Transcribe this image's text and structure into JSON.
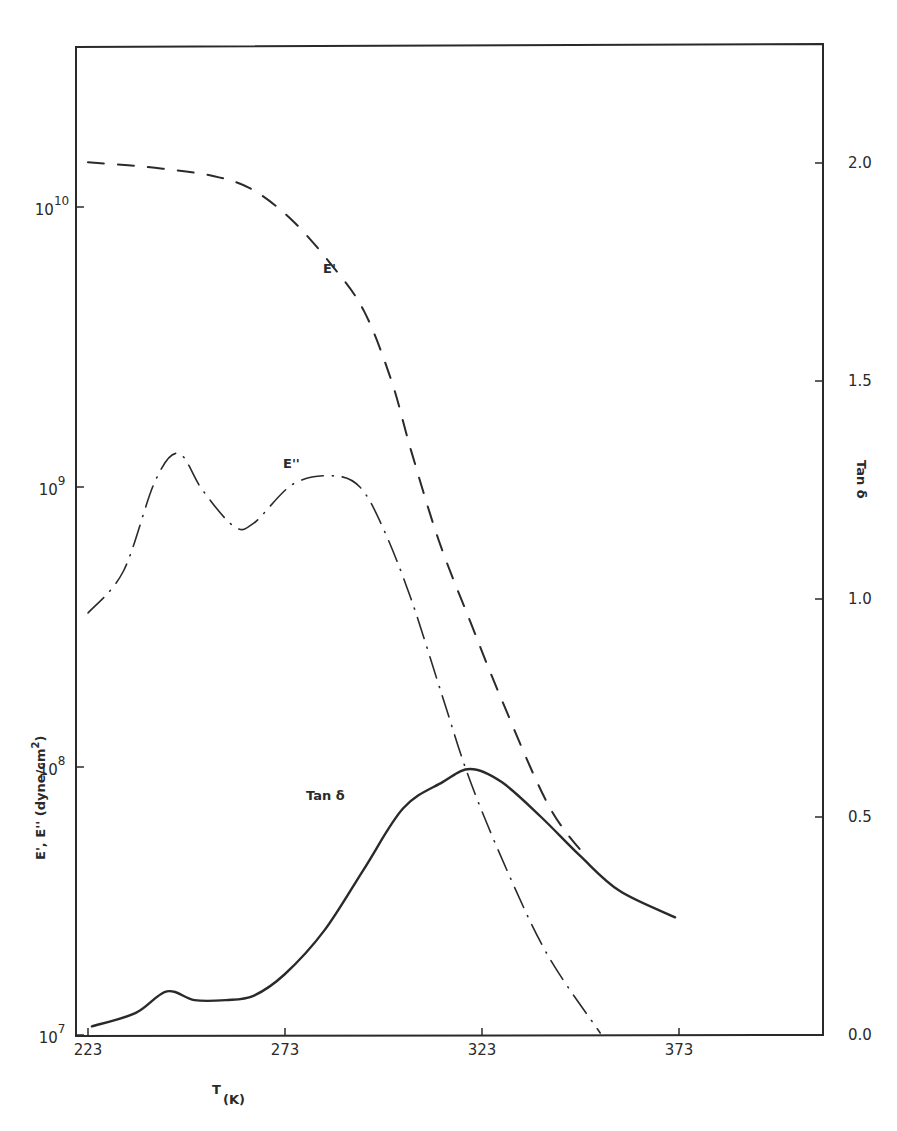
{
  "chart_data": {
    "type": "line",
    "title": "",
    "xlabel": "T",
    "xlabel_unit": "(K)",
    "ylabel": "E', E'' (dyne/cm²)",
    "ylabel_scale": "log",
    "y2label": "Tan δ",
    "xlim": [
      220,
      400
    ],
    "ylim": [
      7,
      10.6
    ],
    "y2lim": [
      0.0,
      2.5
    ],
    "x_ticks": [
      223,
      273,
      323,
      373
    ],
    "y_ticks": [
      {
        "value": 10,
        "base": "10",
        "exp": "10"
      },
      {
        "value": 9,
        "base": "10",
        "exp": "9"
      },
      {
        "value": 8,
        "base": "10",
        "exp": "8"
      },
      {
        "value": 7,
        "base": "10",
        "exp": "7"
      }
    ],
    "y2_ticks": [
      "2.0",
      "1.5",
      "1.0",
      "0.5",
      "0.0"
    ],
    "grid": false,
    "series": [
      {
        "name": "E'",
        "axis": "left",
        "style": "dashed",
        "label_pos": {
          "x": 290,
          "y": 9.88
        },
        "x": [
          223,
          240,
          255,
          265,
          275,
          285,
          293,
          300,
          305,
          312,
          320,
          328,
          340,
          350
        ],
        "values_log10": [
          10.16,
          10.14,
          10.11,
          10.06,
          9.95,
          9.79,
          9.63,
          9.38,
          9.13,
          8.81,
          8.52,
          8.24,
          7.86,
          7.67
        ]
      },
      {
        "name": "E''",
        "axis": "left",
        "style": "dash-dot",
        "label_pos": {
          "x": 276,
          "y": 9.06
        },
        "x": [
          223,
          232,
          240,
          246,
          252,
          260,
          265,
          275,
          285,
          292,
          298,
          305,
          313,
          320,
          330,
          340,
          353
        ],
        "values_log10": [
          8.55,
          8.7,
          9.02,
          9.12,
          8.99,
          8.86,
          8.87,
          9.01,
          9.04,
          9.0,
          8.85,
          8.6,
          8.25,
          7.95,
          7.61,
          7.32,
          7.05
        ]
      },
      {
        "name": "Tan δ",
        "axis": "right",
        "style": "solid",
        "label_pos": {
          "x": 276,
          "y": 0.585
        },
        "x": [
          224,
          235,
          243,
          250,
          258,
          265,
          273,
          283,
          293,
          303,
          313,
          320,
          328,
          338,
          348,
          358,
          372
        ],
        "values": [
          0.02,
          0.05,
          0.1,
          0.08,
          0.08,
          0.09,
          0.14,
          0.24,
          0.38,
          0.52,
          0.58,
          0.61,
          0.58,
          0.5,
          0.41,
          0.33,
          0.27
        ]
      }
    ]
  },
  "labels": {
    "x_title": "T",
    "x_unit": "(K)",
    "y_title": "E', E'' (dyne/cm",
    "y_title_sup": "2",
    "y_title_close": ")",
    "y2_title": "Tan δ",
    "ep_label": "E'",
    "epp_label": "E''",
    "tan_label": "Tan δ"
  },
  "colors": {
    "ink": "#2a2a2a",
    "background": "#ffffff"
  }
}
